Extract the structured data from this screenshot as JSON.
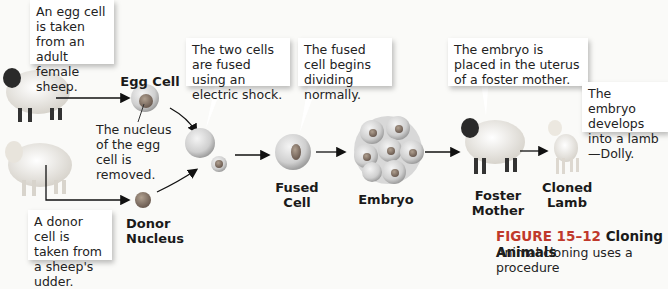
{
  "callouts": {
    "egg_source": "An egg cell is taken from an adult female sheep.",
    "donor_source": "A donor cell is taken from a sheep's udder.",
    "fusion": "The two cells are fused using an electric shock.",
    "dividing": "The fused cell begins dividing normally.",
    "placement": "The embryo is placed in the uterus of a foster mother.",
    "develops": "The embryo develops into a lamb—Dolly."
  },
  "annotations": {
    "nucleus_removed": "The nucleus of the egg cell is removed."
  },
  "labels": {
    "egg_cell": "Egg Cell",
    "donor_nucleus": "Donor Nucleus",
    "fused_cell": "Fused Cell",
    "embryo": "Embryo",
    "foster_mother": "Foster Mother",
    "cloned_lamb": "Cloned Lamb"
  },
  "caption": {
    "figure": "FIGURE 15–12",
    "title": "Cloning Animals",
    "text": "Animal cloning uses a procedure"
  },
  "colors": {
    "caption_figure": "#c0392b",
    "arrow": "#111111",
    "callout_bg": "#ffffff"
  }
}
